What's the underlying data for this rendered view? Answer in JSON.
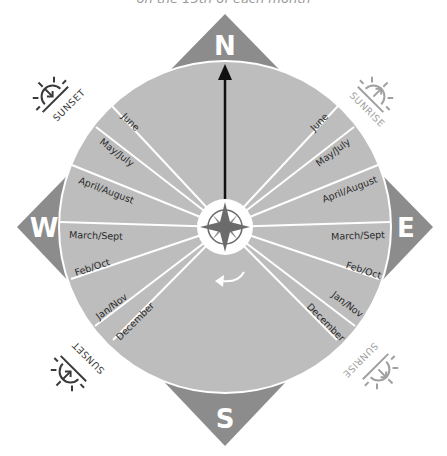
{
  "subtitle": "on the 15th of each month",
  "directions": {
    "north": "N",
    "south": "S",
    "east": "E",
    "west": "W"
  },
  "corner_labels": {
    "top_left": "SUNSET",
    "top_right": "SUNRISE",
    "bottom_left": "SUNSET",
    "bottom_right": "SUNRISE"
  },
  "icons": {
    "top_left": "sunset-icon",
    "top_right": "sunrise-icon",
    "bottom_left": "sunset-icon",
    "bottom_right": "sunrise-icon",
    "center": "compass-rose-icon",
    "needle": "north-arrow-icon",
    "rotation": "rotation-arrow-icon"
  },
  "left_months": [
    "June",
    "May/July",
    "April/August",
    "March/Sept",
    "Feb/Oct",
    "Jan/Nov",
    "December"
  ],
  "right_months": [
    "June",
    "May/July",
    "April/August",
    "March/Sept",
    "Feb/Oct",
    "Jan/Nov",
    "December"
  ],
  "colors": {
    "disc": "#bdbdbd",
    "diamond": "#8c8c8c",
    "compass": "#6b6b6b",
    "sunset_icon": "#3a3a3a",
    "sunrise_icon": "#a0a0a0",
    "divider": "#ffffff"
  }
}
